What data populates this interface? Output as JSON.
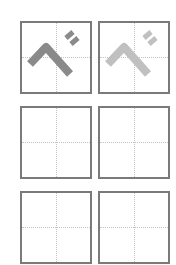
{
  "worksheet": {
    "character": "べ",
    "cells": [
      {
        "row": 1,
        "col": 1,
        "content": "べ",
        "style": "model",
        "color": "#8a8a8a"
      },
      {
        "row": 1,
        "col": 2,
        "content": "べ",
        "style": "trace",
        "color": "#c0c0c0"
      },
      {
        "row": 2,
        "col": 1,
        "content": "",
        "style": "blank"
      },
      {
        "row": 2,
        "col": 2,
        "content": "",
        "style": "blank"
      },
      {
        "row": 3,
        "col": 1,
        "content": "",
        "style": "blank"
      },
      {
        "row": 3,
        "col": 2,
        "content": "",
        "style": "blank"
      }
    ],
    "colors": {
      "border": "#7a7a7a",
      "guide": "#c4c4c4",
      "model_glyph": "#8a8a8a",
      "trace_glyph": "#c0c0c0"
    }
  }
}
